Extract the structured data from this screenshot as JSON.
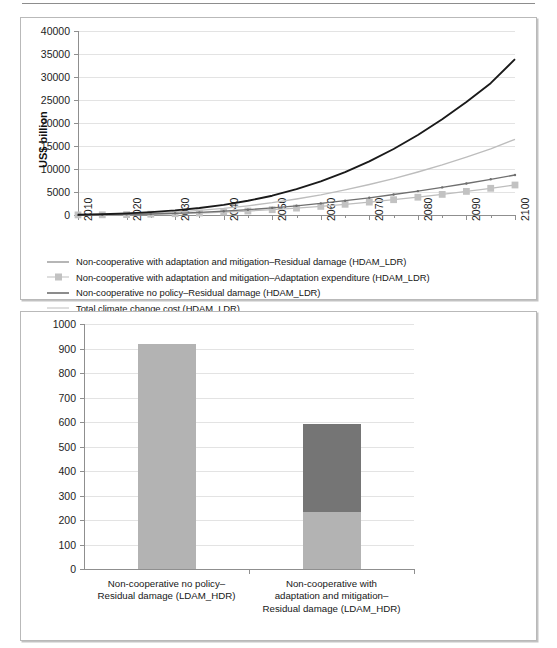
{
  "page": {
    "width": 557,
    "height": 648,
    "background": "#ffffff",
    "rule_color": "#8d8d8d"
  },
  "colors": {
    "black_line": "#1a1a1a",
    "mid_gray_line": "#6f6f6f",
    "light_gray_line": "#bdbdbd",
    "marker_square": "#c2c2c2",
    "bar_residual": "#b3b3b3",
    "bar_adaptation": "#757575",
    "grid": "#e3e3e3",
    "axis": "#8f8f8f"
  },
  "chart_data": [
    {
      "id": "top-chart",
      "type": "line",
      "title": "",
      "xlabel": "",
      "ylabel": "US$ billion",
      "xlim": [
        2010,
        2100
      ],
      "ylim": [
        0,
        40000
      ],
      "ytick_step": 5000,
      "xtick_step": 10,
      "xminor_step": 5,
      "grid": true,
      "legend_position": "below-plot",
      "ytick_labels": [
        "0",
        "5000",
        "10000",
        "15000",
        "20000",
        "25000",
        "30000",
        "35000",
        "40000"
      ],
      "xtick_labels": [
        "2010",
        "2020",
        "2030",
        "2040",
        "2050",
        "2060",
        "2070",
        "2080",
        "2090",
        "2100"
      ],
      "x": [
        2010,
        2015,
        2020,
        2025,
        2030,
        2035,
        2040,
        2045,
        2050,
        2055,
        2060,
        2065,
        2070,
        2075,
        2080,
        2085,
        2090,
        2095,
        2100
      ],
      "series": [
        {
          "name": "Non-cooperative with adaptation and mitigation–Residual damage (HDAM_LDR)",
          "key": "residual_damage",
          "color": "#6f6f6f",
          "marker": "dot",
          "values": [
            20,
            60,
            120,
            220,
            360,
            560,
            820,
            1150,
            1550,
            2000,
            2520,
            3100,
            3750,
            4450,
            5200,
            6000,
            6850,
            7750,
            8700
          ]
        },
        {
          "name": "Non-cooperative with adaptation and mitigation–Adaptation expenditure (HDAM_LDR)",
          "key": "adaptation_expenditure",
          "color": "#bdbdbd",
          "marker": "square",
          "values": [
            15,
            45,
            95,
            170,
            280,
            430,
            620,
            860,
            1150,
            1490,
            1880,
            2320,
            2800,
            3320,
            3880,
            4480,
            5120,
            5800,
            6520
          ]
        },
        {
          "name": "Non-cooperative no policy–Residual damage (HDAM_LDR)",
          "key": "no_policy_residual",
          "color": "#1a1a1a",
          "marker": "none",
          "values": [
            60,
            170,
            340,
            620,
            1000,
            1520,
            2200,
            3080,
            4200,
            5600,
            7300,
            9300,
            11650,
            14350,
            17400,
            20800,
            24550,
            28650,
            33900
          ]
        },
        {
          "name": "Total climate change cost (HDAM_LDR)",
          "key": "total_cost",
          "color": "#bdbdbd",
          "marker": "none",
          "values": [
            35,
            105,
            215,
            390,
            640,
            990,
            1440,
            2000,
            2680,
            3480,
            4400,
            5450,
            6620,
            7920,
            9350,
            10900,
            12580,
            14400,
            16450
          ]
        }
      ]
    },
    {
      "id": "bottom-chart",
      "type": "bar",
      "stacked": true,
      "title": "",
      "xlabel": "",
      "ylabel": "",
      "ylim": [
        0,
        1000
      ],
      "ytick_step": 100,
      "grid": true,
      "legend_position": "right",
      "ytick_labels": [
        "0",
        "100",
        "200",
        "300",
        "400",
        "500",
        "600",
        "700",
        "800",
        "900",
        "1000"
      ],
      "categories": [
        "Non-cooperative no policy–\nResidual damage (LDAM_HDR)",
        "Non-cooperative with\nadaptation and mitigation–\nResidual damage (LDAM_HDR)"
      ],
      "series": [
        {
          "name": "Residual damage",
          "color": "#b3b3b3",
          "values": [
            920,
            232
          ]
        },
        {
          "name": "Adaptation expenditure",
          "color": "#757575",
          "values": [
            0,
            358
          ]
        }
      ],
      "legend": [
        {
          "label": "Adaptation expenditure",
          "color": "#757575"
        },
        {
          "label": "Residual damage",
          "color": "#b3b3b3"
        }
      ]
    }
  ]
}
